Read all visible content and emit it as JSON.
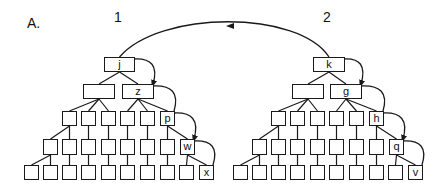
{
  "figure": {
    "panel_label": "A.",
    "tree_labels": [
      "1",
      "2"
    ],
    "colors": {
      "ink": "#1a1a1a",
      "background": "#ffffff"
    }
  },
  "trees": [
    {
      "name": "1",
      "levels": [
        {
          "y": 57,
          "h": 15,
          "w": 31,
          "nodes": [
            {
              "x": 104,
              "label": "j"
            }
          ]
        },
        {
          "y": 84,
          "h": 15,
          "w": 32,
          "nodes": [
            {
              "x": 83,
              "label": ""
            },
            {
              "x": 122,
              "label": "z"
            }
          ]
        },
        {
          "y": 111,
          "h": 15,
          "w": 15,
          "nodes": [
            {
              "x": 62,
              "label": ""
            },
            {
              "x": 81,
              "label": ""
            },
            {
              "x": 101,
              "label": ""
            },
            {
              "x": 120,
              "label": ""
            },
            {
              "x": 140,
              "label": ""
            },
            {
              "x": 160,
              "label": "p"
            }
          ]
        },
        {
          "y": 139,
          "h": 16,
          "w": 15,
          "nodes": [
            {
              "x": 43,
              "label": ""
            },
            {
              "x": 62,
              "label": ""
            },
            {
              "x": 81,
              "label": ""
            },
            {
              "x": 101,
              "label": ""
            },
            {
              "x": 120,
              "label": ""
            },
            {
              "x": 140,
              "label": ""
            },
            {
              "x": 160,
              "label": ""
            },
            {
              "x": 180,
              "label": "w"
            }
          ]
        },
        {
          "y": 165,
          "h": 15,
          "w": 15,
          "nodes": [
            {
              "x": 24,
              "label": ""
            },
            {
              "x": 43,
              "label": ""
            },
            {
              "x": 62,
              "label": ""
            },
            {
              "x": 81,
              "label": ""
            },
            {
              "x": 101,
              "label": ""
            },
            {
              "x": 120,
              "label": ""
            },
            {
              "x": 140,
              "label": ""
            },
            {
              "x": 160,
              "label": ""
            },
            {
              "x": 179,
              "label": ""
            },
            {
              "x": 199,
              "label": "x"
            }
          ]
        }
      ]
    },
    {
      "name": "2",
      "levels": [
        {
          "y": 57,
          "h": 15,
          "w": 32,
          "nodes": [
            {
              "x": 313,
              "label": "k"
            }
          ]
        },
        {
          "y": 84,
          "h": 15,
          "w": 32,
          "nodes": [
            {
              "x": 292,
              "label": ""
            },
            {
              "x": 330,
              "label": "g"
            }
          ]
        },
        {
          "y": 111,
          "h": 15,
          "w": 15,
          "nodes": [
            {
              "x": 271,
              "label": ""
            },
            {
              "x": 290,
              "label": ""
            },
            {
              "x": 310,
              "label": ""
            },
            {
              "x": 329,
              "label": ""
            },
            {
              "x": 349,
              "label": ""
            },
            {
              "x": 369,
              "label": "h"
            }
          ]
        },
        {
          "y": 139,
          "h": 16,
          "w": 15,
          "nodes": [
            {
              "x": 252,
              "label": ""
            },
            {
              "x": 271,
              "label": ""
            },
            {
              "x": 290,
              "label": ""
            },
            {
              "x": 310,
              "label": ""
            },
            {
              "x": 329,
              "label": ""
            },
            {
              "x": 349,
              "label": ""
            },
            {
              "x": 369,
              "label": ""
            },
            {
              "x": 389,
              "label": "q"
            }
          ]
        },
        {
          "y": 165,
          "h": 15,
          "w": 15,
          "nodes": [
            {
              "x": 233,
              "label": ""
            },
            {
              "x": 252,
              "label": ""
            },
            {
              "x": 271,
              "label": ""
            },
            {
              "x": 290,
              "label": ""
            },
            {
              "x": 310,
              "label": ""
            },
            {
              "x": 329,
              "label": ""
            },
            {
              "x": 349,
              "label": ""
            },
            {
              "x": 369,
              "label": ""
            },
            {
              "x": 388,
              "label": ""
            },
            {
              "x": 408,
              "label": "v"
            }
          ]
        }
      ]
    }
  ],
  "arrows": {
    "cross_tree": {
      "from": "k",
      "to": "j",
      "direction": "left"
    },
    "path_1": [
      "j",
      "z",
      "p",
      "w",
      "x"
    ],
    "path_2": [
      "k",
      "g",
      "h",
      "q",
      "v"
    ]
  }
}
